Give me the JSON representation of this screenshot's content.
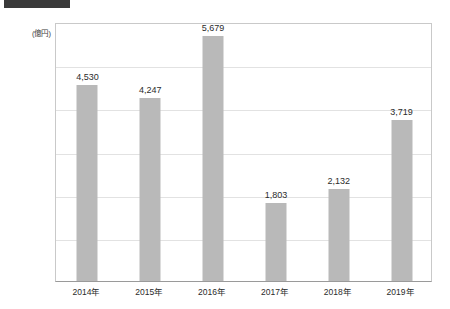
{
  "title_block": {
    "name": "redacted-title-bar",
    "color": "#3a3a3a"
  },
  "chart_data": {
    "type": "bar",
    "title": "",
    "xlabel": "",
    "ylabel": "",
    "unit_label": "(億円)",
    "categories": [
      "2014年",
      "2015年",
      "2016年",
      "2017年",
      "2018年",
      "2019年"
    ],
    "values": [
      4530,
      4247,
      5679,
      1803,
      2132,
      3719
    ],
    "value_labels": [
      "4,530",
      "4,247",
      "5,679",
      "1,803",
      "2,132",
      "3,719"
    ],
    "ylim": [
      0,
      6000
    ],
    "ytick_values": [
      0,
      1000,
      2000,
      3000,
      4000,
      5000,
      6000
    ],
    "ytick_labels": [
      "0",
      "1,000",
      "2,000",
      "3,000",
      "4,000",
      "5,000",
      "6,000"
    ],
    "grid": true,
    "legend": "none",
    "bar_color": "#b9b9b9",
    "gridline_color": "#e2e2e2",
    "axis_color": "#9a9a9a"
  }
}
